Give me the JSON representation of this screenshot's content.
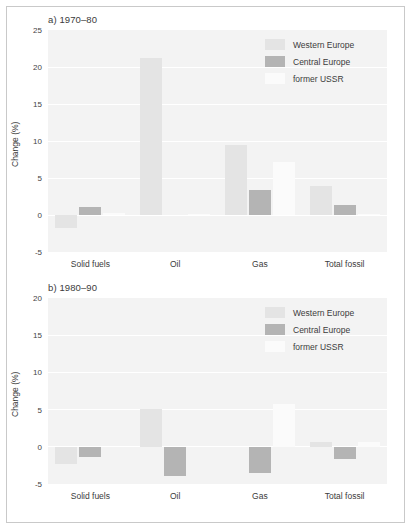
{
  "figure": {
    "background_color": "#ffffff",
    "border_color": "#c9c9c9",
    "plot_background_color": "#f3f3f3",
    "gridline_color": "#ffffff"
  },
  "series_colors": {
    "western_europe": "#e4e4e4",
    "central_europe": "#b4b4b4",
    "former_ussr": "#fbfbfb"
  },
  "legend": {
    "entries": [
      {
        "label": "Western Europe",
        "color": "#e4e4e4"
      },
      {
        "label": "Central Europe",
        "color": "#b4b4b4"
      },
      {
        "label": "former USSR",
        "color": "#fbfbfb"
      }
    ]
  },
  "chart_data": [
    {
      "id": "panel-a",
      "type": "bar",
      "title": "a) 1970–80",
      "xlabel": "",
      "ylabel": "Change (%)",
      "ylim": [
        -5,
        25
      ],
      "yticks": [
        25,
        20,
        15,
        10,
        5,
        0,
        -5
      ],
      "ytick_labels": [
        "25",
        "20",
        "15",
        "10",
        "5",
        "0",
        "-5"
      ],
      "grid": true,
      "legend_position": "top-right",
      "categories": [
        "Solid fuels",
        "Oil",
        "Gas",
        "Total fossil"
      ],
      "series": [
        {
          "name": "Western Europe",
          "color": "#e4e4e4",
          "values": [
            -1.7,
            21.2,
            9.5,
            3.9
          ]
        },
        {
          "name": "Central Europe",
          "color": "#b4b4b4",
          "values": [
            1.1,
            0.0,
            3.4,
            1.4
          ]
        },
        {
          "name": "former USSR",
          "color": "#fbfbfb",
          "values": [
            0.3,
            0.2,
            7.1,
            0.2
          ]
        }
      ]
    },
    {
      "id": "panel-b",
      "type": "bar",
      "title": "b) 1980–90",
      "xlabel": "",
      "ylabel": "Change (%)",
      "ylim": [
        -5,
        20
      ],
      "yticks": [
        20,
        15,
        10,
        5,
        0,
        -5
      ],
      "ytick_labels": [
        "20",
        "15",
        "10",
        "5",
        "0",
        "-5"
      ],
      "grid": true,
      "legend_position": "top-right",
      "categories": [
        "Solid fuels",
        "Oil",
        "Gas",
        "Total fossil"
      ],
      "series": [
        {
          "name": "Western Europe",
          "color": "#e4e4e4",
          "values": [
            -2.3,
            5.1,
            0.0,
            0.7
          ]
        },
        {
          "name": "Central Europe",
          "color": "#b4b4b4",
          "values": [
            -1.4,
            -3.9,
            -3.5,
            -1.7
          ]
        },
        {
          "name": "former USSR",
          "color": "#fbfbfb",
          "values": [
            0.0,
            0.0,
            5.8,
            0.7
          ]
        }
      ]
    }
  ]
}
